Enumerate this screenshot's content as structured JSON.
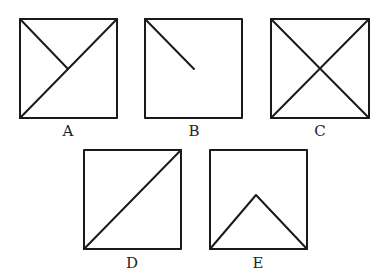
{
  "figures": [
    {
      "label": "A",
      "box": [
        20,
        19,
        117,
        118
      ],
      "lines": [
        [
          20,
          19,
          68,
          69
        ],
        [
          20,
          118,
          117,
          19
        ]
      ]
    },
    {
      "label": "B",
      "box": [
        145,
        19,
        242,
        118
      ],
      "lines": [
        [
          145,
          19,
          194,
          69
        ]
      ]
    },
    {
      "label": "C",
      "box": [
        271,
        19,
        369,
        118
      ],
      "lines": [
        [
          271,
          19,
          369,
          118
        ],
        [
          271,
          118,
          369,
          19
        ]
      ]
    },
    {
      "label": "D",
      "box": [
        84,
        150,
        181,
        249
      ],
      "lines": [
        [
          84,
          249,
          181,
          150
        ]
      ]
    },
    {
      "label": "E",
      "box": [
        210,
        150,
        307,
        249
      ],
      "lines": [
        [
          210,
          249,
          256,
          195
        ],
        [
          256,
          195,
          307,
          249
        ]
      ]
    }
  ],
  "colors": {
    "stroke": "#1a1a1a",
    "background": "#ffffff"
  }
}
